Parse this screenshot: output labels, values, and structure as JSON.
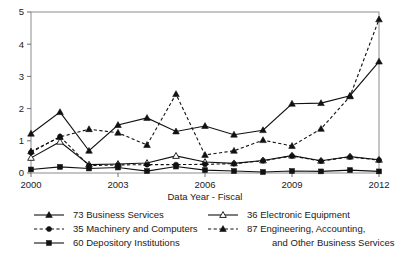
{
  "chart_data": {
    "type": "line",
    "title": "",
    "xlabel": "Data Year - Fiscal",
    "ylabel": "",
    "x": [
      2000,
      2001,
      2002,
      2003,
      2004,
      2005,
      2006,
      2007,
      2008,
      2009,
      2010,
      2011,
      2012
    ],
    "xlim": [
      2000,
      2012
    ],
    "ylim": [
      0,
      5
    ],
    "xticks": [
      2000,
      2003,
      2006,
      2009,
      2012
    ],
    "xtick_labels": [
      "2000",
      "2003",
      "2006",
      "2009",
      "2012"
    ],
    "yticks": [
      0,
      1,
      2,
      3,
      4,
      5
    ],
    "ytick_labels": [
      "0",
      "1",
      "2",
      "3",
      "4",
      "5"
    ],
    "grid": false,
    "legend_position": "bottom",
    "series": [
      {
        "name": "73 Business Services",
        "key": "s73",
        "marker": "triangle-filled",
        "dash": "solid",
        "values": [
          1.22,
          1.89,
          0.69,
          1.49,
          1.71,
          1.29,
          1.46,
          1.19,
          1.33,
          2.15,
          2.17,
          2.4,
          3.46
        ]
      },
      {
        "name": "36 Electronic Equipment",
        "key": "s36",
        "marker": "triangle-open",
        "dash": "solid",
        "values": [
          0.47,
          0.97,
          0.26,
          0.28,
          0.31,
          0.53,
          0.34,
          0.3,
          0.39,
          0.54,
          0.38,
          0.51,
          0.41
        ]
      },
      {
        "name": "35 Machinery and Computers",
        "key": "s35",
        "marker": "circle-filled",
        "dash": "dashed",
        "values": [
          0.64,
          1.13,
          0.23,
          0.25,
          0.26,
          0.26,
          0.27,
          0.29,
          0.38,
          0.53,
          0.37,
          0.5,
          0.4
        ]
      },
      {
        "name": "87 Engineering, Accounting,",
        "name_line2": "and Other Business Services",
        "key": "s87",
        "marker": "triangle-filled",
        "dash": "dashed",
        "values": [
          0.67,
          1.12,
          1.36,
          1.25,
          0.87,
          2.45,
          0.56,
          0.69,
          1.02,
          0.84,
          1.37,
          2.38,
          4.77
        ]
      },
      {
        "name": "60 Depository Institutions",
        "key": "s60",
        "marker": "square-filled",
        "dash": "solid",
        "values": [
          0.11,
          0.19,
          0.14,
          0.17,
          0.06,
          0.2,
          0.09,
          0.06,
          0.03,
          0.06,
          0.05,
          0.09,
          0.05
        ]
      }
    ]
  },
  "legend": {
    "entries": [
      {
        "label": "73 Business Services"
      },
      {
        "label": "36 Electronic Equipment"
      },
      {
        "label": "35 Machinery and Computers"
      },
      {
        "label": "87 Engineering, Accounting,"
      },
      {
        "label": "and Other Business Services"
      },
      {
        "label": "60 Depository Institutions"
      }
    ]
  }
}
